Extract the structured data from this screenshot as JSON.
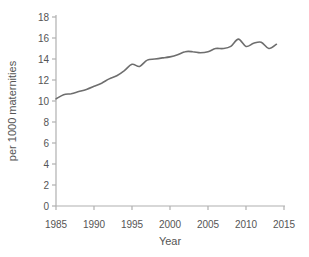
{
  "chart_data": {
    "type": "line",
    "title": "",
    "xlabel": "Year",
    "ylabel": "per 1000 maternities",
    "x": [
      1985,
      1986,
      1987,
      1988,
      1989,
      1990,
      1991,
      1992,
      1993,
      1994,
      1995,
      1996,
      1997,
      1998,
      1999,
      2000,
      2001,
      2002,
      2003,
      2004,
      2005,
      2006,
      2007,
      2008,
      2009,
      2010,
      2011,
      2012,
      2013,
      2014
    ],
    "values": [
      10.2,
      10.6,
      10.7,
      10.9,
      11.1,
      11.4,
      11.7,
      12.1,
      12.4,
      12.9,
      13.5,
      13.3,
      13.9,
      14.0,
      14.1,
      14.2,
      14.4,
      14.7,
      14.7,
      14.6,
      14.7,
      15.0,
      15.0,
      15.2,
      15.9,
      15.2,
      15.5,
      15.6,
      15.0,
      15.4
    ],
    "xlim": [
      1985,
      2015
    ],
    "ylim": [
      0,
      18
    ],
    "xticks": [
      1985,
      1990,
      1995,
      2000,
      2005,
      2010,
      2015
    ],
    "yticks": [
      0,
      2,
      4,
      6,
      8,
      10,
      12,
      14,
      16,
      18
    ],
    "grid": false,
    "legend": false,
    "line_color": "#6e6e6e",
    "axis_color": "#b0b0b0",
    "text_color": "#555555",
    "background": "#ffffff"
  }
}
